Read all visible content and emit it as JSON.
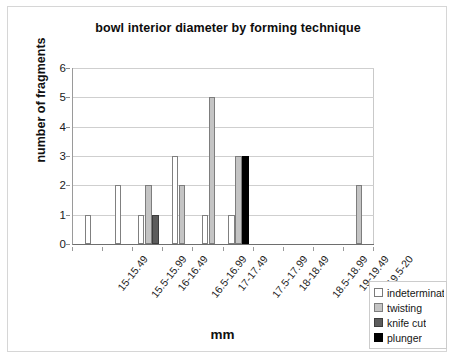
{
  "chart_data": {
    "type": "bar",
    "title": "bowl interior diameter by forming technique",
    "xlabel": "mm",
    "ylabel": "number of fragments",
    "ylim": [
      0,
      6
    ],
    "yticks": [
      0,
      1,
      2,
      3,
      4,
      5,
      6
    ],
    "grid": true,
    "legend_position": "bottom-right",
    "categories": [
      "15-15.49",
      "15.5-15.99",
      "16-16.49",
      "16.5-16.99",
      "17-17.49",
      "17.5-17.99",
      "18-18.49",
      "18.5-18.99",
      "19-19.49",
      "19.5-20"
    ],
    "series": [
      {
        "name": "indeterminate",
        "color": "#ffffff",
        "values": [
          1,
          2,
          1,
          3,
          1,
          1,
          0,
          0,
          0,
          0
        ]
      },
      {
        "name": "twisting",
        "color": "#c4c4c4",
        "values": [
          0,
          0,
          2,
          2,
          5,
          3,
          0,
          0,
          0,
          2
        ]
      },
      {
        "name": "knife cut",
        "color": "#5c5c5c",
        "values": [
          0,
          0,
          1,
          0,
          0,
          0,
          0,
          0,
          0,
          0
        ]
      },
      {
        "name": "plunger",
        "color": "#000000",
        "values": [
          0,
          0,
          0,
          0,
          0,
          3,
          0,
          0,
          0,
          0
        ]
      }
    ]
  },
  "legend": {
    "items": [
      {
        "label": "indeterminate",
        "key": "indeterminate"
      },
      {
        "label": "twisting",
        "key": "twisting"
      },
      {
        "label": "knife cut",
        "key": "knifecut"
      },
      {
        "label": "plunger",
        "key": "plunger"
      }
    ]
  }
}
